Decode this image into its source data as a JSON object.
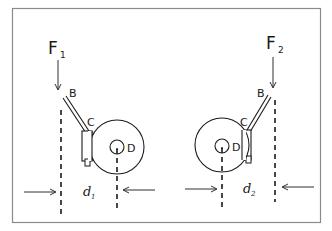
{
  "diagram": {
    "left": {
      "force_label": "F",
      "force_subscript": "1",
      "lever_label": "B",
      "caliper_label": "C",
      "disc_center_label": "D",
      "distance_label": "d",
      "distance_subscript": "1"
    },
    "right": {
      "force_label": "F",
      "force_subscript": "2",
      "lever_label": "B",
      "caliper_label": "C",
      "disc_center_label": "D",
      "distance_label": "d",
      "distance_subscript": "2"
    },
    "colors": {
      "line": "#1a1a1a",
      "frame": "#8a8a8a",
      "background": "#ffffff"
    }
  }
}
